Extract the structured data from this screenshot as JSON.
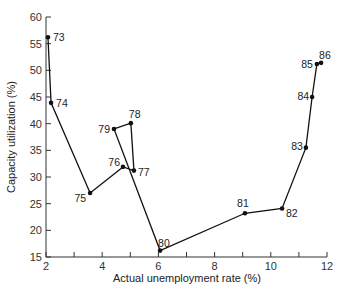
{
  "chart_data": {
    "type": "line",
    "title": "",
    "xlabel": "Actual unemployment rate (%)",
    "ylabel": "Capacity utilization (%)",
    "xlim": [
      2,
      12
    ],
    "ylim": [
      15,
      60
    ],
    "xticks": [
      2,
      4,
      6,
      8,
      10,
      12
    ],
    "xminor": [
      3,
      5,
      7,
      9,
      11
    ],
    "yticks": [
      15,
      20,
      25,
      30,
      35,
      40,
      45,
      50,
      55,
      60
    ],
    "grid": false,
    "legend": null,
    "points": [
      {
        "label": "73",
        "x": 2.07,
        "y": 56.2
      },
      {
        "label": "74",
        "x": 2.18,
        "y": 43.9
      },
      {
        "label": "75",
        "x": 3.57,
        "y": 27.0
      },
      {
        "label": "76",
        "x": 4.74,
        "y": 31.9
      },
      {
        "label": "77",
        "x": 5.13,
        "y": 31.2
      },
      {
        "label": "78",
        "x": 5.02,
        "y": 40.1
      },
      {
        "label": "79",
        "x": 4.42,
        "y": 39.0
      },
      {
        "label": "80",
        "x": 6.06,
        "y": 16.2
      },
      {
        "label": "81",
        "x": 9.08,
        "y": 23.2
      },
      {
        "label": "82",
        "x": 10.4,
        "y": 24.1
      },
      {
        "label": "83",
        "x": 11.25,
        "y": 35.5
      },
      {
        "label": "84",
        "x": 11.47,
        "y": 45.0
      },
      {
        "label": "85",
        "x": 11.64,
        "y": 51.2
      },
      {
        "label": "86",
        "x": 11.79,
        "y": 51.4
      }
    ]
  }
}
